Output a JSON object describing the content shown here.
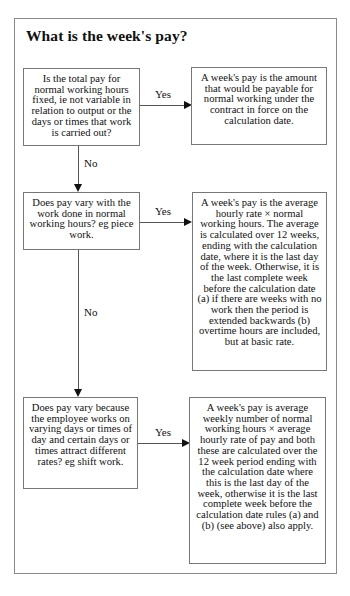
{
  "title": "What is the week's pay?",
  "questions": [
    {
      "text": "Is the total pay for normal working hours fixed, ie not variable in relation to output or the days or times that work is carried out?"
    },
    {
      "text": "Does pay vary with the work done in normal working hours? eg piece work."
    },
    {
      "text": "Does pay vary because the employee works on varying days or times of day and certain days or times attract different rates? eg shift work."
    }
  ],
  "answers": [
    {
      "text": "A week's pay is the amount that would be payable for normal working under the contract in force on the calculation date."
    },
    {
      "text": "A week's pay is the average hourly rate × normal working hours. The average is calculated over 12 weeks, ending with the calculation date, where it is the last day of the week. Otherwise, it is the last complete week before the calculation date (a) if there are weeks with no work then the period is extended backwards (b) overtime hours are included, but at basic rate."
    },
    {
      "text": "A week's pay is average weekly number of normal working hours × average hourly rate of pay and both these are calculated over the 12 week period ending with the calculation date where this is the last day of the week, otherwise it is the last complete week before the calculation date rules (a) and (b) (see above) also apply."
    }
  ],
  "labels": {
    "yes1": "Yes",
    "yes2": "Yes",
    "yes3": "Yes",
    "no1": "No",
    "no2": "No"
  }
}
